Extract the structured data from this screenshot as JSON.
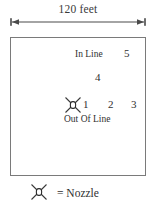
{
  "diagram": {
    "title_dimension": "120 feet",
    "field": {
      "labels": [
        {
          "name": "in-line",
          "text": "In Line"
        },
        {
          "name": "out-of-line",
          "text": "Out Of Line"
        }
      ],
      "nozzle_positions": [
        {
          "id": "5",
          "row": "in-line"
        },
        {
          "id": "4",
          "row": "in-line"
        },
        {
          "id": "1",
          "row": "out-of-line"
        },
        {
          "id": "2",
          "row": "out-of-line"
        },
        {
          "id": "3",
          "row": "out-of-line"
        }
      ],
      "position_5": "5",
      "position_4": "4",
      "position_1": "1",
      "position_2": "2",
      "position_3": "3"
    },
    "legend": {
      "symbol": "nozzle-icon",
      "text": "= Nozzle"
    },
    "colors": {
      "border": "#7a7a7a",
      "text": "#2f2f2f",
      "background": "#ffffff",
      "arrow": "#4a4a4a"
    }
  }
}
